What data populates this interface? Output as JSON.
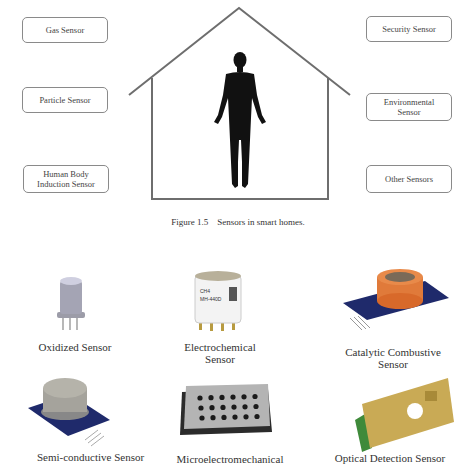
{
  "figure": {
    "caption": "Figure 1.5    Sensors in smart homes.",
    "left_sensors": [
      {
        "label_lines": [
          "Gas Sensor"
        ]
      },
      {
        "label_lines": [
          "Particle Sensor"
        ]
      },
      {
        "label_lines": [
          "Human Body",
          "Induction Sensor"
        ]
      }
    ],
    "right_sensors": [
      {
        "label_lines": [
          "Security Sensor"
        ]
      },
      {
        "label_lines": [
          "Environmental",
          "Sensor"
        ]
      },
      {
        "label_lines": [
          "Other Sensors"
        ]
      }
    ],
    "center": {
      "icon": "house-icon",
      "figure_icon": "human-silhouette-icon"
    }
  },
  "gallery": {
    "items": [
      {
        "name": "Oxidized Sensor",
        "label_lines": [
          "Oxidized Sensor"
        ],
        "icon": "oxidized-sensor-icon"
      },
      {
        "name": "Electrochemical Sensor",
        "label_lines": [
          "Electrochemical",
          "Sensor"
        ],
        "icon": "electrochemical-sensor-icon",
        "printed_text": [
          "CH4",
          "MH-440D"
        ]
      },
      {
        "name": "Catalytic Combustive Sensor",
        "label_lines": [
          "Catalytic Combustive",
          "Sensor"
        ],
        "icon": "catalytic-sensor-icon"
      },
      {
        "name": "Semi-conductive Sensor",
        "label_lines": [
          "Semi-conductive Sensor"
        ],
        "icon": "semiconductive-sensor-icon"
      },
      {
        "name": "Microelectromechanical",
        "label_lines": [
          "Microelectromechanical"
        ],
        "icon": "mems-sensor-icon"
      },
      {
        "name": "Optical Detection Sensor",
        "label_lines": [
          "Optical Detection Sensor"
        ],
        "icon": "optical-sensor-icon"
      }
    ]
  },
  "colors": {
    "line": "#6e6e6e",
    "box_border": "#8a8a8a",
    "orange_cap": "#e07a3a",
    "pcb_blue": "#1f2a6b",
    "gold": "#c9aa55"
  }
}
